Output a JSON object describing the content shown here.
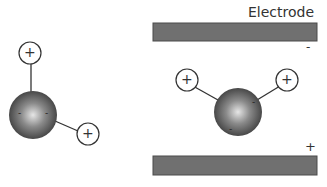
{
  "labels": {
    "electrode": "Electrode",
    "top_sign": "-",
    "bottom_sign": "+"
  },
  "molecule_left": {
    "h1_sign": "+",
    "h2_sign": "+",
    "o_signs": [
      "-",
      "-"
    ]
  },
  "molecule_right": {
    "h1_sign": "+",
    "h2_sign": "+",
    "o_signs": [
      "-",
      "-"
    ]
  },
  "colors": {
    "electrode": "#6e6e6e",
    "electrode_border": "#4a4a4a",
    "sphere_dark": "#3a3a3a",
    "sphere_light": "#e8e8e8",
    "bond": "#333333"
  }
}
